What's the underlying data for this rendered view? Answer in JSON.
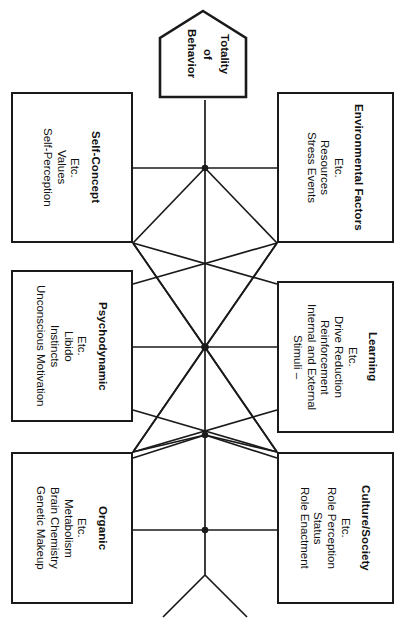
{
  "diagram": {
    "type": "node-link-diagram",
    "orientation": "rotated-90",
    "line_color": "#1a1a1a",
    "box_border_color": "#1a1a1a",
    "background_color": "#ffffff",
    "text_color": "#111111"
  },
  "apex": {
    "name": "totality-of-behavior",
    "shape": "pentagon-house",
    "lines": [
      "Totality",
      "of",
      "Behavior"
    ]
  },
  "nodes": [
    {
      "id": "self-concept",
      "title": "Self-Concept",
      "items": [
        "Self-Perception",
        "Values",
        "Etc."
      ]
    },
    {
      "id": "environmental-factors",
      "title": "Environmental Factors",
      "items": [
        "Stress Events",
        "Resources",
        "Etc."
      ]
    },
    {
      "id": "psychodynamic",
      "title": "Psychodynamic",
      "items": [
        "Unconscious Motivation",
        "Instincts",
        "Libido",
        "Etc."
      ]
    },
    {
      "id": "learning",
      "title": "Learning",
      "items": [
        "Stimuli –",
        "Internal and External",
        "Reinforcement",
        "Drive Reduction",
        "Etc."
      ]
    },
    {
      "id": "organic",
      "title": "Organic",
      "items": [
        "Genetic Makeup",
        "Brain Chemistry",
        "Metabolism",
        "Etc."
      ]
    },
    {
      "id": "culture-society",
      "title": "Culture/Society",
      "items": [
        "Role Enactment",
        "Status",
        "Role Perception",
        "Etc."
      ]
    }
  ],
  "junctions": [
    {
      "id": "junction-upper",
      "x": 205,
      "y": 168
    },
    {
      "id": "junction-hub",
      "x": 205,
      "y": 347
    },
    {
      "id": "junction-lower",
      "x": 205,
      "y": 435
    },
    {
      "id": "junction-bottom",
      "x": 205,
      "y": 530
    }
  ]
}
